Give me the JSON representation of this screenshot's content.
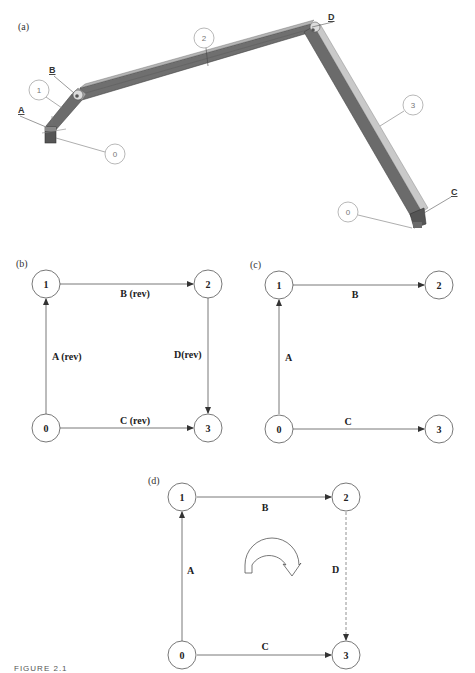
{
  "figure": {
    "caption": "FIGURE 2.1",
    "panels": {
      "a": {
        "label": "(a)",
        "joints": [
          "A",
          "B",
          "C",
          "D"
        ],
        "links": [
          {
            "callout": "0",
            "role": "ground-left"
          },
          {
            "callout": "1",
            "role": "crank"
          },
          {
            "callout": "2",
            "role": "coupler"
          },
          {
            "callout": "3",
            "role": "rocker"
          },
          {
            "callout": "0",
            "role": "ground-right"
          }
        ]
      },
      "b": {
        "label": "(b)",
        "nodes": [
          "0",
          "1",
          "2",
          "3"
        ],
        "edges": [
          {
            "from": "0",
            "to": "1",
            "label": "A (rev)",
            "style": "solid"
          },
          {
            "from": "1",
            "to": "2",
            "label": "B (rev)",
            "style": "solid"
          },
          {
            "from": "2",
            "to": "3",
            "label": "D(rev)",
            "style": "solid"
          },
          {
            "from": "0",
            "to": "3",
            "label": "C (rev)",
            "style": "solid"
          }
        ]
      },
      "c": {
        "label": "(c)",
        "nodes": [
          "0",
          "1",
          "2",
          "3"
        ],
        "edges": [
          {
            "from": "0",
            "to": "1",
            "label": "A",
            "style": "solid"
          },
          {
            "from": "1",
            "to": "2",
            "label": "B",
            "style": "solid"
          },
          {
            "from": "0",
            "to": "3",
            "label": "C",
            "style": "solid"
          }
        ]
      },
      "d": {
        "label": "(d)",
        "nodes": [
          "0",
          "1",
          "2",
          "3"
        ],
        "edges": [
          {
            "from": "0",
            "to": "1",
            "label": "A",
            "style": "solid"
          },
          {
            "from": "1",
            "to": "2",
            "label": "B",
            "style": "solid"
          },
          {
            "from": "2",
            "to": "3",
            "label": "D",
            "style": "dashed"
          },
          {
            "from": "0",
            "to": "3",
            "label": "C",
            "style": "solid"
          }
        ],
        "loop_direction": "clockwise"
      }
    }
  }
}
